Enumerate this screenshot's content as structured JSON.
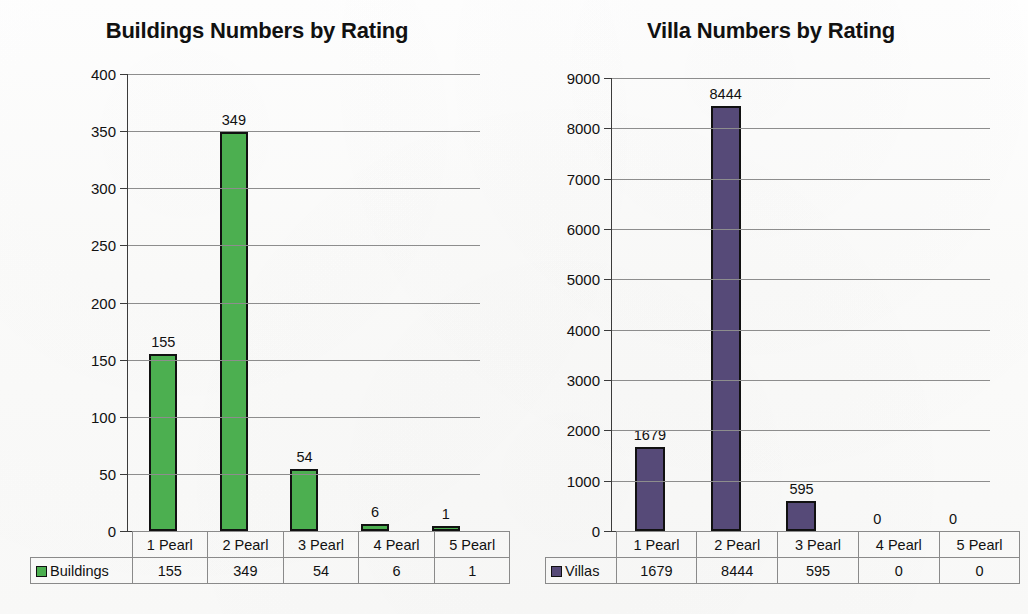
{
  "chart_data": [
    {
      "type": "bar",
      "id": "buildings",
      "title": "Buildings Numbers by Rating",
      "categories": [
        "1 Pearl",
        "2 Pearl",
        "3 Pearl",
        "4 Pearl",
        "5 Pearl"
      ],
      "values": [
        155,
        349,
        54,
        6,
        1
      ],
      "series_name": "Buildings",
      "xlabel": "",
      "ylabel": "",
      "ylim": [
        0,
        400
      ],
      "ytick_labels": [
        "400",
        "350",
        "300",
        "250",
        "200",
        "150",
        "100",
        "50",
        "0"
      ],
      "ytick_values": [
        400,
        350,
        300,
        250,
        200,
        150,
        100,
        50,
        0
      ],
      "grid": true,
      "legend_position": "table-row-header",
      "bar_color": "#4caf50",
      "bar_border_color": "#111111",
      "data_labels": [
        "155",
        "349",
        "54",
        "6",
        "1"
      ]
    },
    {
      "type": "bar",
      "id": "villas",
      "title": "Villa Numbers by Rating",
      "categories": [
        "1 Pearl",
        "2 Pearl",
        "3 Pearl",
        "4 Pearl",
        "5 Pearl"
      ],
      "values": [
        1679,
        8444,
        595,
        0,
        0
      ],
      "series_name": "Villas",
      "xlabel": "",
      "ylabel": "",
      "ylim": [
        0,
        9000
      ],
      "ytick_labels": [
        "9000",
        "8000",
        "7000",
        "6000",
        "5000",
        "4000",
        "3000",
        "2000",
        "1000",
        "0"
      ],
      "ytick_values": [
        9000,
        8000,
        7000,
        6000,
        5000,
        4000,
        3000,
        2000,
        1000,
        0
      ],
      "grid": true,
      "legend_position": "table-row-header",
      "bar_color": "#564a78",
      "bar_border_color": "#111111",
      "data_labels": [
        "1679",
        "8444",
        "595",
        "0",
        "0"
      ]
    }
  ]
}
